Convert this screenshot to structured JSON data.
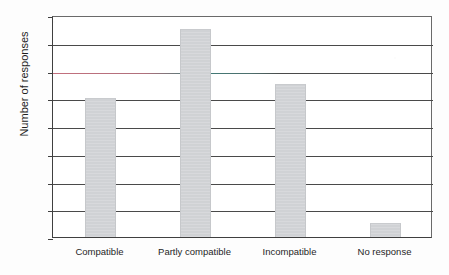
{
  "figure": {
    "background_color": "#fdfdfd",
    "plot_background_color": "#ffffff",
    "bar_color": "#d2d4d7",
    "axis_color": "#3f3f3f",
    "gridline_color": "#4a4a4a",
    "tinted_gridline_value": 12,
    "tinted_gridline_colors": [
      "#c4707e",
      "#3f7d79"
    ],
    "title_remnant": "",
    "ylabel_text": "Number of responses"
  },
  "chart_data": {
    "type": "bar",
    "title": "",
    "xlabel": "",
    "ylabel": "Number of responses",
    "categories": [
      "Compatible",
      "Partly compatible",
      "Incompatible",
      "No response"
    ],
    "values": [
      10,
      15,
      11,
      1
    ],
    "ylim": [
      0,
      16
    ],
    "ytick_labels": [
      "0",
      "2",
      "4",
      "6",
      "8",
      "10",
      "12",
      "14",
      "16"
    ],
    "ytick_values": [
      0,
      2,
      4,
      6,
      8,
      10,
      12,
      14,
      16
    ],
    "grid": true,
    "grid_axis": "y",
    "legend": false,
    "legend_position": "none"
  }
}
